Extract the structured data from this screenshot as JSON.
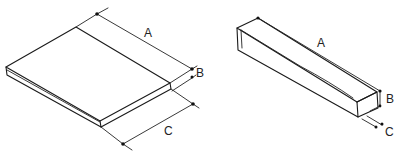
{
  "figure": {
    "type": "isometric dimension sketch",
    "panels": [
      {
        "id": "slab",
        "description": "Flat board / slab",
        "dimensions": [
          {
            "key": "A",
            "label": "A",
            "meaning": "length"
          },
          {
            "key": "B",
            "label": "B",
            "meaning": "thickness"
          },
          {
            "key": "C",
            "label": "C",
            "meaning": "width"
          }
        ]
      },
      {
        "id": "bar",
        "description": "Long rectangular bar / stick",
        "dimensions": [
          {
            "key": "A",
            "label": "A",
            "meaning": "length"
          },
          {
            "key": "B",
            "label": "B",
            "meaning": "height"
          },
          {
            "key": "C",
            "label": "C",
            "meaning": "width"
          }
        ]
      }
    ]
  },
  "colors": {
    "line": "#1a1a1a",
    "background": "#ffffff"
  }
}
